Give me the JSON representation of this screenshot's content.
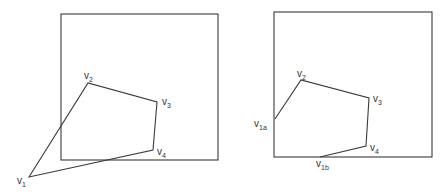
{
  "diagram": {
    "panels": [
      {
        "name": "before-clipping",
        "clip_window": {
          "x1": 61,
          "y1": 14,
          "x2": 218,
          "y2": 160
        },
        "polygon": [
          {
            "id": "v1",
            "label": "v",
            "sub": "1",
            "x": 29,
            "y": 177,
            "lx": 17,
            "ly": 184
          },
          {
            "id": "v2",
            "label": "v",
            "sub": "2",
            "x": 88,
            "y": 83,
            "lx": 84,
            "ly": 79
          },
          {
            "id": "v3",
            "label": "v",
            "sub": "3",
            "x": 157,
            "y": 102,
            "lx": 162,
            "ly": 105
          },
          {
            "id": "v4",
            "label": "v",
            "sub": "4",
            "x": 153,
            "y": 150,
            "lx": 157,
            "ly": 155
          }
        ]
      },
      {
        "name": "after-clipping",
        "clip_window": {
          "x1": 274,
          "y1": 12,
          "x2": 432,
          "y2": 157
        },
        "polygon": [
          {
            "id": "v1a",
            "label": "v",
            "sub": "1a",
            "x": 275,
            "y": 119,
            "lx": 254,
            "ly": 127
          },
          {
            "id": "v2",
            "label": "v",
            "sub": "2",
            "x": 301,
            "y": 80,
            "lx": 297,
            "ly": 77
          },
          {
            "id": "v3",
            "label": "v",
            "sub": "3",
            "x": 369,
            "y": 98,
            "lx": 373,
            "ly": 102
          },
          {
            "id": "v4",
            "label": "v",
            "sub": "4",
            "x": 366,
            "y": 146,
            "lx": 370,
            "ly": 151
          },
          {
            "id": "v1b",
            "label": "v",
            "sub": "1b",
            "x": 320,
            "y": 157,
            "lx": 316,
            "ly": 167
          }
        ]
      }
    ],
    "colors": {
      "stroke": "#3a3a3a",
      "background": "#ffffff"
    }
  }
}
